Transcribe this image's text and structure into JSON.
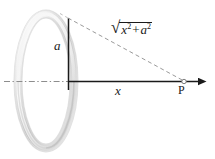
{
  "figure": {
    "colors": {
      "line_dark": "#1a1a1a",
      "dashed_grey": "#9a9a9a",
      "axis_dashdot": "#8d8d8d",
      "ring_light": "#fbfbfb",
      "ring_mid": "#d9d9d9",
      "ring_dark": "#9f9f9f",
      "background": "#ffffff"
    },
    "ring": {
      "name": "charged-ring",
      "center_x": 46,
      "center_y": 81,
      "semi_axis_x": 28,
      "semi_axis_y": 67,
      "tube_thickness": 7
    },
    "axis": {
      "y": 81,
      "dashdot_start_x": 4,
      "origin_x": 68,
      "arrow_tip_x": 207
    },
    "radius_line": {
      "x": 68,
      "top_y": 18,
      "bottom_y": 90
    },
    "hypotenuse": {
      "x1": 68,
      "y1": 18,
      "x2": 184,
      "y2": 81
    },
    "point_p": {
      "x": 184,
      "y": 81
    }
  },
  "labels": {
    "radius": "a",
    "distance": "x",
    "point": "P",
    "hypotenuse": {
      "radical": "√",
      "term1_var": "x",
      "term1_exp": "2",
      "operator": "+",
      "term2_var": "a",
      "term2_exp": "2",
      "plain": "√(x² + a²)"
    }
  }
}
